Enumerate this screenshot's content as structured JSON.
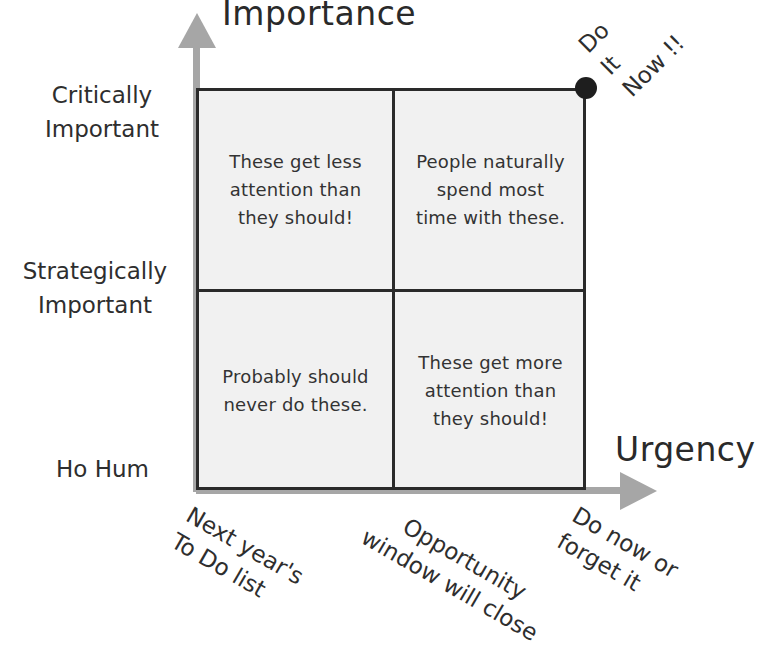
{
  "diagram": {
    "type": "quadrant-matrix",
    "y_axis": {
      "title": "Importance",
      "levels": [
        {
          "label": "Critically\nImportant"
        },
        {
          "label": "Strategically\nImportant"
        },
        {
          "label": "Ho Hum"
        }
      ]
    },
    "x_axis": {
      "title": "Urgency",
      "levels": [
        {
          "label": "Next year's\nTo Do list"
        },
        {
          "label": "Opportunity\nwindow will close"
        },
        {
          "label": "Do now or\nforget it"
        }
      ]
    },
    "corner_marker": {
      "label": "Do\nIt\nNow !!",
      "color": "#1e1e1e"
    },
    "quadrants": {
      "top_left": "These get less\nattention than\nthey should!",
      "top_right": "People naturally\nspend most\ntime with these.",
      "bottom_left": "Probably should\nnever do these.",
      "bottom_right": "These get more\nattention than\nthey should!"
    },
    "colors": {
      "arrow": "#a6a6a6",
      "grid_line": "#2a2a2a",
      "quadrant_fill": "#f1f1f1",
      "text": "#2e2e2e"
    }
  }
}
